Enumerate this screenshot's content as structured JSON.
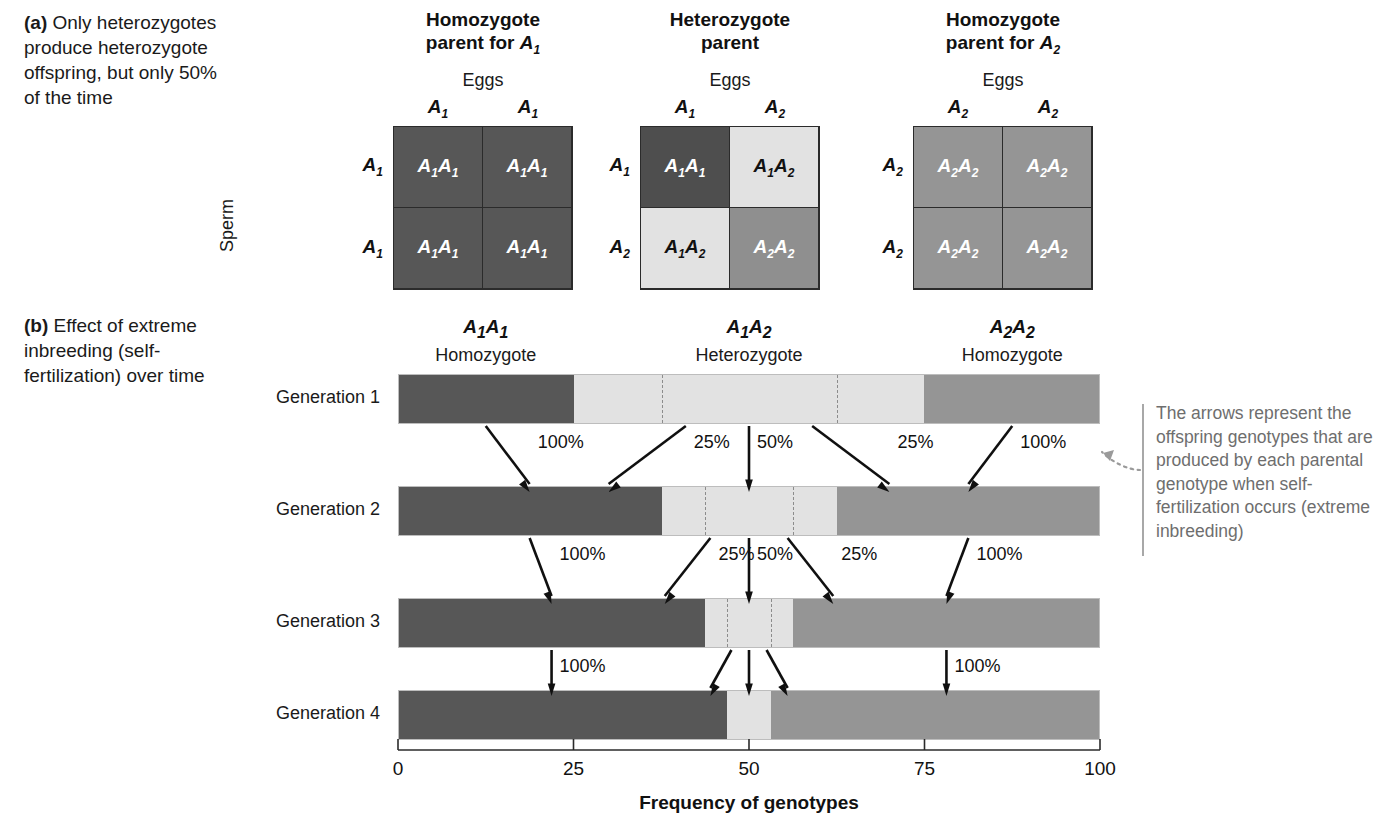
{
  "figure": {
    "panel_a": {
      "letter": "(a)",
      "caption": "Only heterozygotes produce heterozygote offspring, but only 50% of the time",
      "sperm_axis_label": "Sperm",
      "eggs_axis_label": "Eggs",
      "squares": [
        {
          "title_line1": "Homozygote",
          "title_line2": "parent for A₁",
          "title_plain": "Homozygote parent for A1",
          "eggs_label": "Eggs",
          "col_headers": [
            "A₁",
            "A₁"
          ],
          "row_headers": [
            "A₁",
            "A₁"
          ],
          "cells": [
            {
              "genotype": "A₁A₁",
              "fill": "#575757",
              "text_color": "#ffffff"
            },
            {
              "genotype": "A₁A₁",
              "fill": "#575757",
              "text_color": "#ffffff"
            },
            {
              "genotype": "A₁A₁",
              "fill": "#575757",
              "text_color": "#ffffff"
            },
            {
              "genotype": "A₁A₁",
              "fill": "#575757",
              "text_color": "#ffffff"
            }
          ]
        },
        {
          "title_line1": "Heterozygote",
          "title_line2": "parent",
          "title_plain": "Heterozygote parent",
          "eggs_label": "Eggs",
          "col_headers": [
            "A₁",
            "A₂"
          ],
          "row_headers": [
            "A₁",
            "A₂"
          ],
          "cells": [
            {
              "genotype": "A₁A₁",
              "fill": "#4e4e4e",
              "text_color": "#ffffff"
            },
            {
              "genotype": "A₁A₂",
              "fill": "#e2e2e2",
              "text_color": "#111111"
            },
            {
              "genotype": "A₁A₂",
              "fill": "#e2e2e2",
              "text_color": "#111111"
            },
            {
              "genotype": "A₂A₂",
              "fill": "#8f8f8f",
              "text_color": "#ffffff"
            }
          ]
        },
        {
          "title_line1": "Homozygote",
          "title_line2": "parent for A₂",
          "title_plain": "Homozygote parent for A2",
          "eggs_label": "Eggs",
          "col_headers": [
            "A₂",
            "A₂"
          ],
          "row_headers": [
            "A₂",
            "A₂"
          ],
          "cells": [
            {
              "genotype": "A₂A₂",
              "fill": "#959595",
              "text_color": "#ffffff"
            },
            {
              "genotype": "A₂A₂",
              "fill": "#959595",
              "text_color": "#ffffff"
            },
            {
              "genotype": "A₂A₂",
              "fill": "#959595",
              "text_color": "#ffffff"
            },
            {
              "genotype": "A₂A₂",
              "fill": "#959595",
              "text_color": "#ffffff"
            }
          ]
        }
      ]
    },
    "panel_b": {
      "letter": "(b)",
      "caption": "Effect of extreme inbreeding (self-fertilization) over time",
      "genotype_headers": [
        {
          "allele": "A₁A₁",
          "zygosity": "Homozygote",
          "center_pct": 12.5
        },
        {
          "allele": "A₁A₂",
          "zygosity": "Heterozygote",
          "center_pct": 50
        },
        {
          "allele": "A₂A₂",
          "zygosity": "Homozygote",
          "center_pct": 87.5
        }
      ],
      "annotation": "The arrows represent the offspring genotypes that are produced by each parental genotype when self-fertilization occurs (extreme inbreeding)",
      "axis": {
        "title": "Frequency of genotypes",
        "ticks": [
          "0",
          "25",
          "50",
          "75",
          "100"
        ],
        "tick_values": [
          0,
          25,
          50,
          75,
          100
        ],
        "min": 0,
        "max": 100
      }
    }
  },
  "colors": {
    "A1A1_dark": "#575757",
    "A1A2_light": "#e2e2e2",
    "A2A2_medium": "#959595",
    "annotation_gray": "#6e6e6e",
    "divider_dash": "#8c8c8c"
  },
  "chart_data": {
    "type": "bar",
    "title": "Effect of extreme inbreeding (self-fertilization) over time",
    "xlabel": "Frequency of genotypes",
    "ylabel": "",
    "xlim": [
      0,
      100
    ],
    "grid": false,
    "legend": "none",
    "orientation": "horizontal-stacked",
    "categories": [
      "Generation 1",
      "Generation 2",
      "Generation 3",
      "Generation 4"
    ],
    "series": [
      {
        "name": "A₁A₁ Homozygote",
        "color": "#575757",
        "values": [
          25,
          37.5,
          43.75,
          46.875
        ]
      },
      {
        "name": "A₁A₂ Heterozygote",
        "color": "#e2e2e2",
        "values": [
          50,
          25,
          12.5,
          6.25
        ]
      },
      {
        "name": "A₂A₂ Homozygote",
        "color": "#959595",
        "values": [
          25,
          37.5,
          43.75,
          46.875
        ]
      }
    ],
    "rows": [
      {
        "label": "Generation 1",
        "segments": [
          {
            "genotype": "A₁A₁",
            "start": 0,
            "end": 25,
            "color": "#575757"
          },
          {
            "genotype": "A₁A₂",
            "start": 25,
            "end": 75,
            "color": "#e2e2e2",
            "internal_dividers": [
              37.5,
              62.5
            ]
          },
          {
            "genotype": "A₂A₂",
            "start": 75,
            "end": 100,
            "color": "#959595"
          }
        ]
      },
      {
        "label": "Generation 2",
        "segments": [
          {
            "genotype": "A₁A₁",
            "start": 0,
            "end": 37.5,
            "color": "#575757"
          },
          {
            "genotype": "A₁A₂",
            "start": 37.5,
            "end": 62.5,
            "color": "#e2e2e2",
            "internal_dividers": [
              43.75,
              56.25
            ]
          },
          {
            "genotype": "A₂A₂",
            "start": 62.5,
            "end": 100,
            "color": "#959595"
          }
        ]
      },
      {
        "label": "Generation 3",
        "segments": [
          {
            "genotype": "A₁A₁",
            "start": 0,
            "end": 43.75,
            "color": "#575757"
          },
          {
            "genotype": "A₁A₂",
            "start": 43.75,
            "end": 56.25,
            "color": "#e2e2e2",
            "internal_dividers": [
              46.875,
              53.125
            ]
          },
          {
            "genotype": "A₂A₂",
            "start": 56.25,
            "end": 100,
            "color": "#959595"
          }
        ]
      },
      {
        "label": "Generation 4",
        "segments": [
          {
            "genotype": "A₁A₁",
            "start": 0,
            "end": 46.875,
            "color": "#575757"
          },
          {
            "genotype": "A₁A₂",
            "start": 46.875,
            "end": 53.125,
            "color": "#e2e2e2"
          },
          {
            "genotype": "A₂A₂",
            "start": 53.125,
            "end": 100,
            "color": "#959595"
          }
        ]
      }
    ],
    "transitions": [
      {
        "from": "Generation 1",
        "to": "Generation 2",
        "arrows": [
          {
            "label": "100%",
            "from_pct": 12.5,
            "to_pct": 18.75
          },
          {
            "label": "25%",
            "from_pct": 41.0,
            "to_pct": 30.0
          },
          {
            "label": "50%",
            "from_pct": 50.0,
            "to_pct": 50.0
          },
          {
            "label": "25%",
            "from_pct": 59.0,
            "to_pct": 70.0
          },
          {
            "label": "100%",
            "from_pct": 87.5,
            "to_pct": 81.25
          }
        ]
      },
      {
        "from": "Generation 2",
        "to": "Generation 3",
        "arrows": [
          {
            "label": "100%",
            "from_pct": 18.75,
            "to_pct": 21.875
          },
          {
            "label": "25%",
            "from_pct": 44.5,
            "to_pct": 38.0
          },
          {
            "label": "50%",
            "from_pct": 50.0,
            "to_pct": 50.0
          },
          {
            "label": "25%",
            "from_pct": 55.5,
            "to_pct": 62.0
          },
          {
            "label": "100%",
            "from_pct": 81.25,
            "to_pct": 78.125
          }
        ]
      },
      {
        "from": "Generation 3",
        "to": "Generation 4",
        "arrows": [
          {
            "label": "100%",
            "from_pct": 21.875,
            "to_pct": 21.875
          },
          {
            "label": "",
            "from_pct": 47.5,
            "to_pct": 44.5
          },
          {
            "label": "",
            "from_pct": 50.0,
            "to_pct": 50.0
          },
          {
            "label": "",
            "from_pct": 52.5,
            "to_pct": 55.5
          },
          {
            "label": "100%",
            "from_pct": 78.125,
            "to_pct": 78.125
          }
        ]
      }
    ]
  }
}
